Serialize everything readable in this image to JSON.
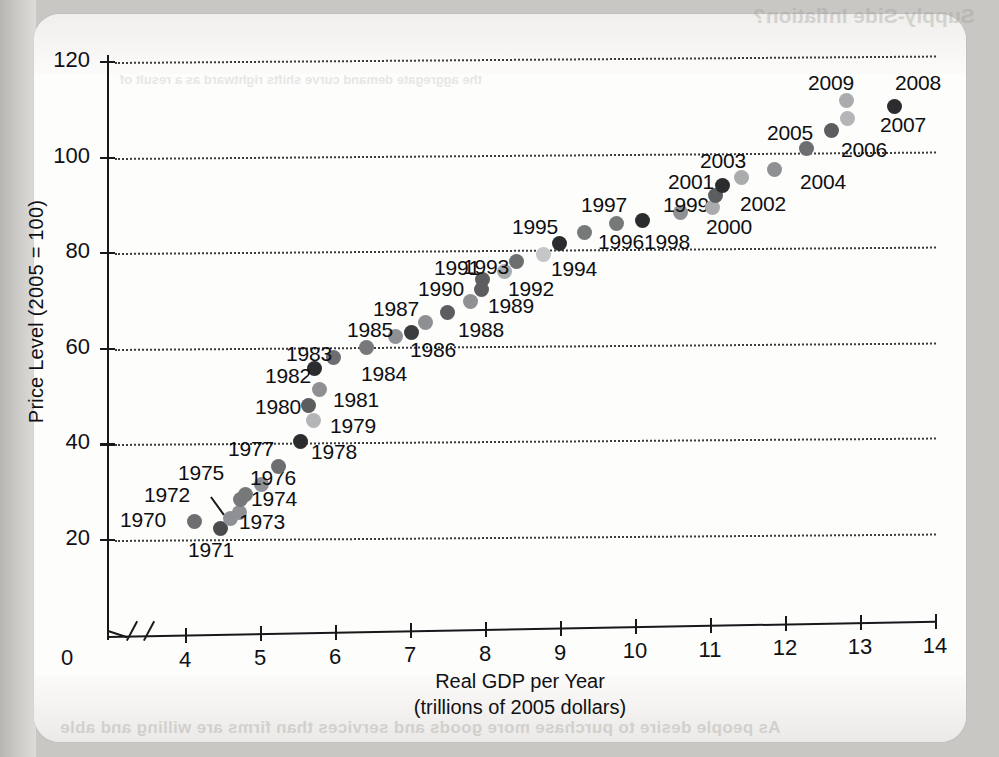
{
  "page": {
    "ghost_title": "Supply-Side Inflation?",
    "ghost_line": "As people desire to purchase more goods and services than firms are willing and able",
    "ghost_mid": "the aggregate demand curve shifts rightward as a result of"
  },
  "chart_data": {
    "type": "scatter",
    "title": "",
    "xlabel": "Real GDP per Year",
    "xlabel_sub": "(trillions of 2005 dollars)",
    "ylabel": "Price Level (2005 = 100)",
    "xlim": [
      4,
      14
    ],
    "ylim": [
      20,
      120
    ],
    "x_origin_label": "0",
    "x_axis_break": true,
    "grid": "horizontal-dotted",
    "legend": "none",
    "xticks": [
      "4",
      "5",
      "6",
      "7",
      "8",
      "9",
      "10",
      "11",
      "12",
      "13",
      "14"
    ],
    "yticks": [
      "20",
      "40",
      "60",
      "80",
      "100",
      "120"
    ],
    "points": [
      {
        "label": "1970",
        "x": 4.13,
        "y": 23.9,
        "shade": "#6d6e70",
        "lx": 120,
        "ly": 508
      },
      {
        "label": "1971",
        "x": 4.47,
        "y": 22.5,
        "shade": "#4a4b4d",
        "lx": 188,
        "ly": 538
      },
      {
        "label": "1972",
        "x": 4.6,
        "y": 24.4,
        "shade": "#8e9093",
        "lx": 144,
        "ly": 483
      },
      {
        "label": "1973",
        "x": 4.72,
        "y": 25.8,
        "shade": "#8e9093",
        "lx": 239,
        "ly": 510
      },
      {
        "label": "1974",
        "x": 4.74,
        "y": 28.4,
        "shade": "#76787a",
        "lx": 251,
        "ly": 487
      },
      {
        "label": "1975",
        "x": 4.81,
        "y": 29.5,
        "shade": "#76787a",
        "lx": 178,
        "ly": 461
      },
      {
        "label": "1976",
        "x": 5.02,
        "y": 31.7,
        "shade": "#8e9093",
        "lx": 250,
        "ly": 466
      },
      {
        "label": "1977",
        "x": 5.25,
        "y": 35.4,
        "shade": "#6d6e70",
        "lx": 228,
        "ly": 437
      },
      {
        "label": "1978",
        "x": 5.54,
        "y": 40.6,
        "shade": "#2b2c2e",
        "lx": 311,
        "ly": 440
      },
      {
        "label": "1979",
        "x": 5.71,
        "y": 44.9,
        "shade": "#b3b5b7",
        "lx": 330,
        "ly": 414
      },
      {
        "label": "1980",
        "x": 5.65,
        "y": 48.2,
        "shade": "#5c5d5f",
        "lx": 255,
        "ly": 395
      },
      {
        "label": "1981",
        "x": 5.79,
        "y": 51.5,
        "shade": "#8e9093",
        "lx": 333,
        "ly": 388
      },
      {
        "label": "1982",
        "x": 5.72,
        "y": 55.8,
        "shade": "#2b2c2e",
        "lx": 265,
        "ly": 364
      },
      {
        "label": "1983",
        "x": 5.98,
        "y": 58.1,
        "shade": "#6d6e70",
        "lx": 286,
        "ly": 342
      },
      {
        "label": "1984",
        "x": 6.42,
        "y": 60.2,
        "shade": "#76787a",
        "lx": 361,
        "ly": 362
      },
      {
        "label": "1985",
        "x": 6.81,
        "y": 62.5,
        "shade": "#8e9093",
        "lx": 347,
        "ly": 318
      },
      {
        "label": "1986",
        "x": 7.02,
        "y": 63.4,
        "shade": "#3b3c3e",
        "lx": 410,
        "ly": 338
      },
      {
        "label": "1987",
        "x": 7.2,
        "y": 65.4,
        "shade": "#8e9093",
        "lx": 373,
        "ly": 297
      },
      {
        "label": "1988",
        "x": 7.5,
        "y": 67.6,
        "shade": "#5c5d5f",
        "lx": 458,
        "ly": 318
      },
      {
        "label": "1989",
        "x": 7.8,
        "y": 69.9,
        "shade": "#8e9093",
        "lx": 488,
        "ly": 294
      },
      {
        "label": "1990",
        "x": 7.95,
        "y": 72.5,
        "shade": "#5c5d5f",
        "lx": 418,
        "ly": 277
      },
      {
        "label": "1991",
        "x": 7.96,
        "y": 74.6,
        "shade": "#5c5d5f",
        "lx": 434,
        "ly": 256
      },
      {
        "label": "1992",
        "x": 8.26,
        "y": 76.2,
        "shade": "#a9abad",
        "lx": 508,
        "ly": 277
      },
      {
        "label": "1993",
        "x": 8.42,
        "y": 78.2,
        "shade": "#6d6e70",
        "lx": 463,
        "ly": 255
      },
      {
        "label": "1994",
        "x": 8.78,
        "y": 79.7,
        "shade": "#c4c6c8",
        "lx": 551,
        "ly": 257
      },
      {
        "label": "1995",
        "x": 8.99,
        "y": 82.0,
        "shade": "#2b2c2e",
        "lx": 512,
        "ly": 215
      },
      {
        "label": "1996",
        "x": 9.32,
        "y": 84.3,
        "shade": "#76787a",
        "lx": 598,
        "ly": 230
      },
      {
        "label": "1997",
        "x": 9.75,
        "y": 86.2,
        "shade": "#76787a",
        "lx": 581,
        "ly": 193
      },
      {
        "label": "1998",
        "x": 10.1,
        "y": 86.8,
        "shade": "#2b2c2e",
        "lx": 644,
        "ly": 230
      },
      {
        "label": "1999",
        "x": 10.6,
        "y": 88.6,
        "shade": "#8e9093",
        "lx": 663,
        "ly": 193
      },
      {
        "label": "2000",
        "x": 11.03,
        "y": 89.5,
        "shade": "#a9abad",
        "lx": 706,
        "ly": 215
      },
      {
        "label": "2001",
        "x": 11.07,
        "y": 92.1,
        "shade": "#5c5d5f",
        "lx": 668,
        "ly": 170
      },
      {
        "label": "2002",
        "x": 11.17,
        "y": 94.1,
        "shade": "#2b2c2e",
        "lx": 740,
        "ly": 192
      },
      {
        "label": "2003",
        "x": 11.42,
        "y": 95.8,
        "shade": "#a9abad",
        "lx": 700,
        "ly": 149
      },
      {
        "label": "2004",
        "x": 11.86,
        "y": 97.6,
        "shade": "#8e9093",
        "lx": 800,
        "ly": 170
      },
      {
        "label": "2005",
        "x": 12.28,
        "y": 101.8,
        "shade": "#6d6e70",
        "lx": 767,
        "ly": 121
      },
      {
        "label": "2006",
        "x": 12.62,
        "y": 105.6,
        "shade": "#5c5d5f",
        "lx": 841,
        "ly": 138
      },
      {
        "label": "2007",
        "x": 12.83,
        "y": 108.2,
        "shade": "#b3b5b7",
        "lx": 880,
        "ly": 113
      },
      {
        "label": "2008",
        "x": 13.46,
        "y": 110.6,
        "shade": "#2b2c2e",
        "lx": 895,
        "ly": 71
      },
      {
        "label": "2009",
        "x": 12.82,
        "y": 111.9,
        "shade": "#a9abad",
        "lx": 808,
        "ly": 71
      }
    ]
  }
}
